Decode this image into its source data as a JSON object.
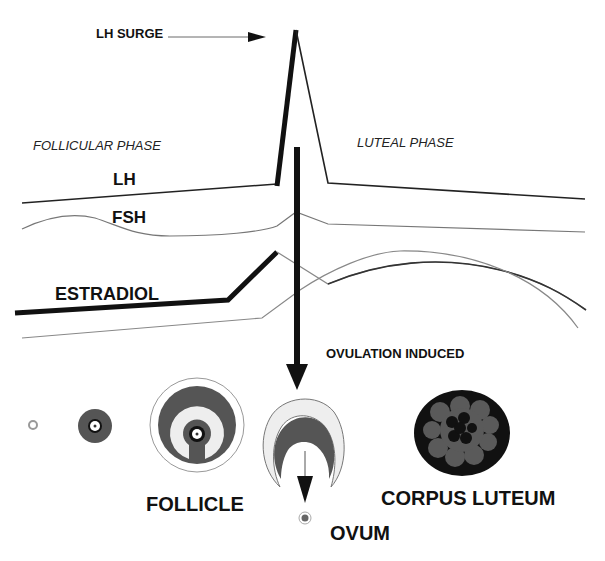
{
  "labels": {
    "lh_surge": "LH SURGE",
    "follicular_phase": "FOLLICULAR PHASE",
    "luteal_phase": "LUTEAL PHASE",
    "lh": "LH",
    "fsh": "FSH",
    "estradiol": "ESTRADIOL",
    "ovulation_induced": "OVULATION INDUCED",
    "follicle": "FOLLICLE",
    "corpus_luteum": "CORPUS LUTEUM",
    "ovum": "OVUM"
  },
  "colors": {
    "line_dark": "#111111",
    "line_gray": "#777777",
    "follicle_dark": "#555555",
    "follicle_light": "#eeeeee",
    "corpus_outer": "#111111",
    "corpus_mid": "#5a5a5a"
  },
  "stages": [
    {
      "name": "primordial-follicle"
    },
    {
      "name": "primary-follicle"
    },
    {
      "name": "antral-follicle"
    },
    {
      "name": "ruptured-follicle"
    },
    {
      "name": "corpus-luteum"
    }
  ]
}
